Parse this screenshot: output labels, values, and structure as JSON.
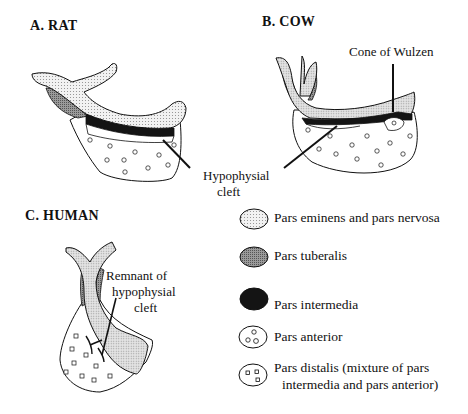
{
  "panels": {
    "rat": {
      "title": "A.  RAT"
    },
    "cow": {
      "title": "B.  COW",
      "annotation": "Cone of Wulzen"
    },
    "human": {
      "title": "C.  HUMAN",
      "annotation_line1": "Remnant of",
      "annotation_line2": "hypophysial",
      "annotation_line3": "cleft"
    }
  },
  "shared_annotation": {
    "line1": "Hypophysial",
    "line2": "cleft"
  },
  "legend": {
    "items": [
      {
        "label": "Pars eminens and pars nervosa",
        "swatch": "light-dotted"
      },
      {
        "label": "Pars tuberalis",
        "swatch": "mid-gray-hatched"
      },
      {
        "label": "Pars intermedia",
        "swatch": "black-dense"
      },
      {
        "label": "Pars anterior",
        "swatch": "circles"
      },
      {
        "label": "Pars distalis (mixture of pars",
        "label_line2": "intermedia and pars anterior)",
        "swatch": "squares"
      }
    ]
  },
  "colors": {
    "outline": "#111111",
    "nervosa_fill": "#e6e6e6",
    "tuberalis_fill": "#8c8c8c",
    "intermedia_fill": "#151515",
    "background": "#ffffff"
  }
}
